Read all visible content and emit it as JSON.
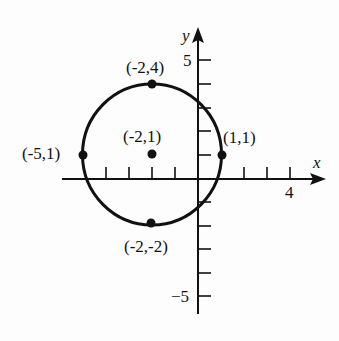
{
  "diagram": {
    "type": "coordinate-plane-circle",
    "axes": {
      "x_label": "x",
      "y_label": "y",
      "x_tick_label": "4",
      "y_tick_label_top": "5",
      "y_tick_label_bottom": "−5",
      "x_range": [
        -6,
        5
      ],
      "y_range": [
        -5.8,
        6.3
      ]
    },
    "circle": {
      "center": [
        -2,
        1
      ],
      "radius": 3
    },
    "points": [
      {
        "label": "(-2,4)",
        "x": -2,
        "y": 4
      },
      {
        "label": "(-2,1)",
        "x": -2,
        "y": 1
      },
      {
        "label": "(-5,1)",
        "x": -5,
        "y": 1
      },
      {
        "label": "(1,1)",
        "x": 1,
        "y": 1
      },
      {
        "label": "(-2,-2)",
        "x": -2,
        "y": -2
      }
    ],
    "colors": {
      "ink": "#111111",
      "background": "#fdfdfd"
    }
  }
}
